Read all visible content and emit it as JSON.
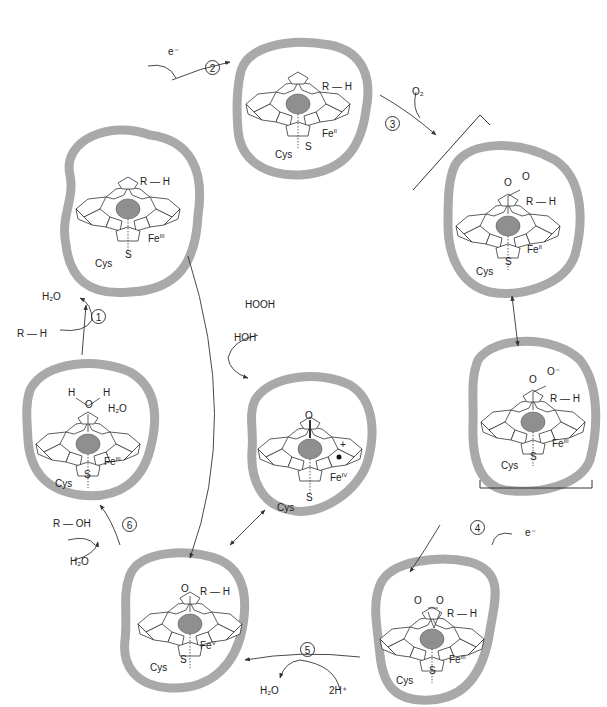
{
  "colors": {
    "pocket_border": "#a9a9a9",
    "iron": "#8f8f8f",
    "line": "#333333",
    "text": "#222222"
  },
  "states": [
    {
      "id": "A",
      "cx": 130,
      "cy": 212,
      "rx": 72,
      "ry": 82,
      "substrate": "R—H",
      "ligand": "",
      "iron": "Fe",
      "ox": "III",
      "cys": "Cys",
      "s": "S"
    },
    {
      "id": "B",
      "cx": 300,
      "cy": 110,
      "rx": 70,
      "ry": 75,
      "substrate": "R—H",
      "ligand": "",
      "iron": "Fe",
      "ox": "II",
      "cys": "Cys",
      "s": "S"
    },
    {
      "id": "C",
      "cx": 510,
      "cy": 220,
      "rx": 70,
      "ry": 80,
      "substrate": "R—H",
      "ligand": "O–O",
      "iron": "Fe",
      "ox": "II",
      "cys": "Cys",
      "s": "S"
    },
    {
      "id": "D",
      "cx": 530,
      "cy": 410,
      "rx": 70,
      "ry": 82,
      "substrate": "R—H",
      "ligand": "O–O⁻",
      "iron": "Fe",
      "ox": "III",
      "cys": "Cys",
      "s": "S"
    },
    {
      "id": "E",
      "cx": 450,
      "cy": 630,
      "rx": 72,
      "ry": 80,
      "substrate": "R—H",
      "ligand": "O–O (peroxo)",
      "iron": "Fe",
      "ox": "III",
      "cys": "Cys",
      "s": "S"
    },
    {
      "id": "F",
      "cx": 190,
      "cy": 615,
      "rx": 72,
      "ry": 78,
      "substrate": "R—H",
      "ligand": "O",
      "iron": "Fe",
      "ox": "V",
      "cys": "Cys",
      "s": "S"
    },
    {
      "id": "G",
      "cx": 310,
      "cy": 445,
      "rx": 62,
      "ry": 82,
      "substrate": "",
      "ligand": "O",
      "iron": "Fe",
      "ox": "IV",
      "cys": "Cys",
      "s": "S",
      "radical": "+•"
    },
    {
      "id": "H",
      "cx": 80,
      "cy": 437,
      "rx": 72,
      "ry": 82,
      "substrate": "",
      "ligand": "H–O–H",
      "extra": "H₂O",
      "iron": "Fe",
      "ox": "III",
      "cys": "Cys",
      "s": "S"
    }
  ],
  "steps": [
    {
      "n": "1",
      "reactant": "R — H",
      "product": "H₂O"
    },
    {
      "n": "2",
      "reactant": "e⁻"
    },
    {
      "n": "3",
      "reactant": "O₂"
    },
    {
      "n": "4",
      "reactant": "e⁻"
    },
    {
      "n": "5",
      "reactant": "2H⁺",
      "product": "H₂O"
    },
    {
      "n": "6",
      "reactant": "H₂O",
      "product": "R — OH"
    }
  ],
  "shunt": {
    "reactant": "HOOH",
    "product": "HOH"
  },
  "labels": {
    "s1_h2o": "H₂O",
    "s1_rh": "R — H",
    "s1_num": "1",
    "s2_e": "e⁻",
    "s2_num": "2",
    "s3_o2": "O₂",
    "s3_num": "3",
    "s4_e": "e⁻",
    "s4_num": "4",
    "s5_h2o": "H₂O",
    "s5_2h": "2H⁺",
    "s5_num": "5",
    "s6_roh": "R — OH",
    "s6_h2o": "H₂O",
    "s6_num": "6",
    "shunt_hooh": "HOOH",
    "shunt_hoh": "HOH",
    "rh": "R — H",
    "cys": "Cys",
    "s": "S",
    "fe": "Fe",
    "ox_A": "III",
    "ox_B": "II",
    "ox_C": "II",
    "ox_D": "III",
    "ox_E": "III",
    "ox_F": "V",
    "ox_G": "IV",
    "ox_H": "III",
    "o": "O",
    "o_minus": "O⁻",
    "h": "H",
    "h2o": "H₂O",
    "plus": "+"
  }
}
